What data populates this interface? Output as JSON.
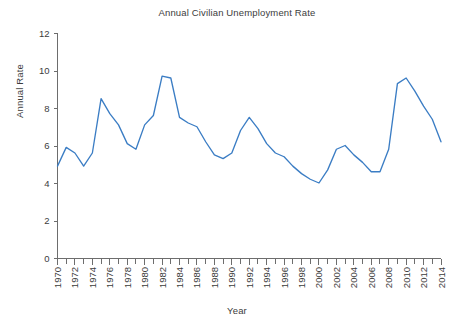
{
  "chart_data": {
    "type": "line",
    "title": "Annual Civilian Unemployment Rate",
    "xlabel": "Year",
    "ylabel": "Annual Rate",
    "grid": false,
    "legend": "none",
    "line_color": "#3b7dc4",
    "axis_color": "#6d6d6d",
    "xlim": [
      1970,
      2014
    ],
    "ylim": [
      0,
      12
    ],
    "ytick_values": [
      0,
      2,
      4,
      6,
      8,
      10,
      12
    ],
    "ytick_labels": [
      "0",
      "2",
      "4",
      "6",
      "8",
      "10",
      "12"
    ],
    "xtick_labels": [
      "1970",
      "1972",
      "1974",
      "1976",
      "1978",
      "1980",
      "1982",
      "1984",
      "1986",
      "1988",
      "1990",
      "1992",
      "1994",
      "1996",
      "1998",
      "2000",
      "2002",
      "2004",
      "2006",
      "2008",
      "2010",
      "2012",
      "2014"
    ],
    "xtick_values": [
      1970,
      1972,
      1974,
      1976,
      1978,
      1980,
      1982,
      1984,
      1986,
      1988,
      1990,
      1992,
      1994,
      1996,
      1998,
      2000,
      2002,
      2004,
      2006,
      2008,
      2010,
      2012,
      2014
    ],
    "xtick_minor_step": 1,
    "x": [
      1970,
      1971,
      1972,
      1973,
      1974,
      1975,
      1976,
      1977,
      1978,
      1979,
      1980,
      1981,
      1982,
      1983,
      1984,
      1985,
      1986,
      1987,
      1988,
      1989,
      1990,
      1991,
      1992,
      1993,
      1994,
      1995,
      1996,
      1997,
      1998,
      1999,
      2000,
      2001,
      2002,
      2003,
      2004,
      2005,
      2006,
      2007,
      2008,
      2009,
      2010,
      2011,
      2012,
      2013,
      2014
    ],
    "values": [
      4.9,
      5.9,
      5.6,
      4.9,
      5.6,
      8.5,
      7.7,
      7.1,
      6.1,
      5.8,
      7.1,
      7.6,
      9.7,
      9.6,
      7.5,
      7.2,
      7.0,
      6.2,
      5.5,
      5.3,
      5.6,
      6.8,
      7.5,
      6.9,
      6.1,
      5.6,
      5.4,
      4.9,
      4.5,
      4.2,
      4.0,
      4.7,
      5.8,
      6.0,
      5.5,
      5.1,
      4.6,
      4.6,
      5.8,
      9.3,
      9.6,
      8.9,
      8.1,
      7.4,
      6.2
    ],
    "series": [
      {
        "name": "Annual Civilian Unemployment Rate",
        "values": [
          4.9,
          5.9,
          5.6,
          4.9,
          5.6,
          8.5,
          7.7,
          7.1,
          6.1,
          5.8,
          7.1,
          7.6,
          9.7,
          9.6,
          7.5,
          7.2,
          7.0,
          6.2,
          5.5,
          5.3,
          5.6,
          6.8,
          7.5,
          6.9,
          6.1,
          5.6,
          5.4,
          4.9,
          4.5,
          4.2,
          4.0,
          4.7,
          5.8,
          6.0,
          5.5,
          5.1,
          4.6,
          4.6,
          5.8,
          9.3,
          9.6,
          8.9,
          8.1,
          7.4,
          6.2
        ]
      }
    ]
  }
}
